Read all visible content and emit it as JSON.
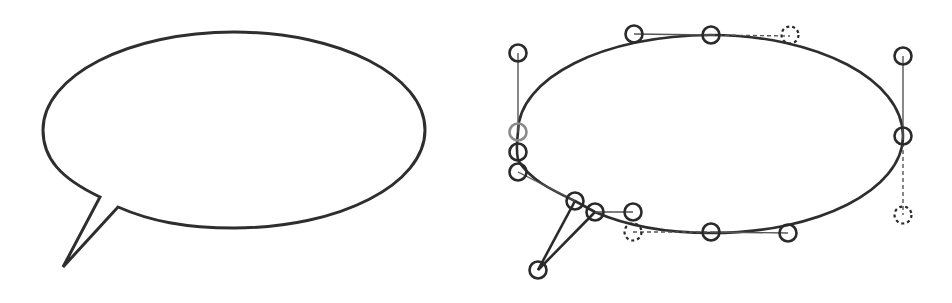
{
  "figure": {
    "stroke_color": "#2e2e2e",
    "background": "#ffffff"
  },
  "left_panel": {
    "name": "speech-bubble",
    "ellipse": {
      "cx": 234,
      "cy": 130,
      "rx": 191,
      "ry": 98
    },
    "tail": {
      "base_left": [
        100,
        197
      ],
      "tip": [
        63,
        267
      ],
      "base_right": [
        118,
        207
      ]
    }
  },
  "right_panel": {
    "name": "bezier-construction",
    "ellipse": {
      "cx": 710,
      "cy": 134,
      "rx": 193,
      "ry": 99
    },
    "anchor_nodes": [
      {
        "id": "left-mid",
        "x": 518,
        "y": 132,
        "style": "gray"
      },
      {
        "id": "left-lower-1",
        "x": 518,
        "y": 152,
        "style": "solid"
      },
      {
        "id": "left-lower-2",
        "x": 518,
        "y": 172,
        "style": "solid"
      },
      {
        "id": "top-1",
        "x": 634,
        "y": 34,
        "style": "solid"
      },
      {
        "id": "top-2",
        "x": 711,
        "y": 35,
        "style": "solid"
      },
      {
        "id": "top-3",
        "x": 790,
        "y": 34,
        "style": "dashed"
      },
      {
        "id": "right-mid",
        "x": 903,
        "y": 136,
        "style": "solid"
      },
      {
        "id": "right-lower",
        "x": 903,
        "y": 215,
        "style": "dashed"
      },
      {
        "id": "right-top",
        "x": 903,
        "y": 56,
        "style": "solid"
      },
      {
        "id": "left-top",
        "x": 518,
        "y": 53,
        "style": "solid"
      },
      {
        "id": "tail-base-1",
        "x": 575,
        "y": 201,
        "style": "solid"
      },
      {
        "id": "tail-base-2",
        "x": 595,
        "y": 212,
        "style": "solid"
      },
      {
        "id": "bottom-1",
        "x": 633,
        "y": 212,
        "style": "solid"
      },
      {
        "id": "bottom-1-dashed",
        "x": 633,
        "y": 232,
        "style": "dashed"
      },
      {
        "id": "bottom-2",
        "x": 711,
        "y": 232,
        "style": "solid"
      },
      {
        "id": "bottom-3",
        "x": 788,
        "y": 233,
        "style": "solid"
      },
      {
        "id": "tail-tip",
        "x": 538,
        "y": 270,
        "style": "solid"
      }
    ]
  }
}
